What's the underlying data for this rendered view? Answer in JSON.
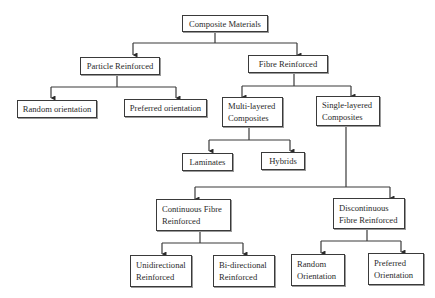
{
  "diagram": {
    "title": "Composite Materials",
    "nodes": {
      "root": "Composite Materials",
      "particle": "Particle Reinforced",
      "fibre": "Fibre Reinforced",
      "particle_random": "Random orientation",
      "particle_preferred": "Preferred orientation",
      "multi_layered": "Multi-layered\nComposites",
      "single_layered": "Single-layered\nComposites",
      "laminates": "Laminates",
      "hybrids": "Hybrids",
      "continuous": "Continuous Fibre\nReinforced",
      "discontinuous": "Discontinuous\nFibre Reinforced",
      "unidirectional": "Unidirectional\nReinforced",
      "bidirectional": "Bi-directional\nReinforced",
      "random_orientation": "Random\nOrientation",
      "preferred_orientation": "Preferred\nOrientation"
    },
    "edges": [
      [
        "root",
        "particle"
      ],
      [
        "root",
        "fibre"
      ],
      [
        "particle",
        "particle_random"
      ],
      [
        "particle",
        "particle_preferred"
      ],
      [
        "fibre",
        "multi_layered"
      ],
      [
        "fibre",
        "single_layered"
      ],
      [
        "multi_layered",
        "laminates"
      ],
      [
        "multi_layered",
        "hybrids"
      ],
      [
        "single_layered",
        "continuous"
      ],
      [
        "single_layered",
        "discontinuous"
      ],
      [
        "continuous",
        "unidirectional"
      ],
      [
        "continuous",
        "bidirectional"
      ],
      [
        "discontinuous",
        "random_orientation"
      ],
      [
        "discontinuous",
        "preferred_orientation"
      ]
    ],
    "colors": {
      "line": "#3a3a3a",
      "box_border": "#3a3a3a",
      "text": "#2a2a2a",
      "background": "#ffffff"
    }
  }
}
